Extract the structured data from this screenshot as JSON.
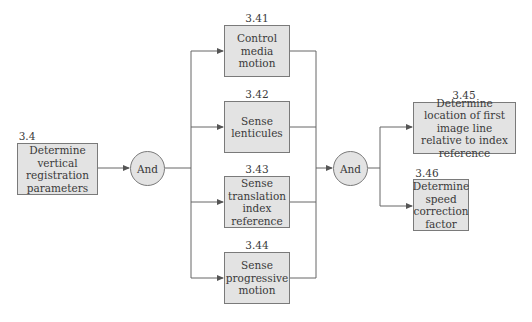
{
  "diagram": {
    "type": "function decomposition (AND tree)",
    "colors": {
      "box_fill": "#e3e3e3",
      "box_border": "#7a7a7a",
      "line": "#555555",
      "text": "#3a3a3a"
    },
    "root": {
      "id": "3.4",
      "label": "Determine vertical registration parameters"
    },
    "gate1": {
      "label": "And"
    },
    "children": [
      {
        "id": "3.41",
        "label": "Control media motion"
      },
      {
        "id": "3.42",
        "label": "Sense lenticules"
      },
      {
        "id": "3.43",
        "label": "Sense translation index reference"
      },
      {
        "id": "3.44",
        "label": "Sense progressive motion"
      }
    ],
    "gate2": {
      "label": "And"
    },
    "outputs": [
      {
        "id": "3.45",
        "label": "Determine location of first image line relative to index reference"
      },
      {
        "id": "3.46",
        "label": "Determine speed correction factor"
      }
    ]
  }
}
